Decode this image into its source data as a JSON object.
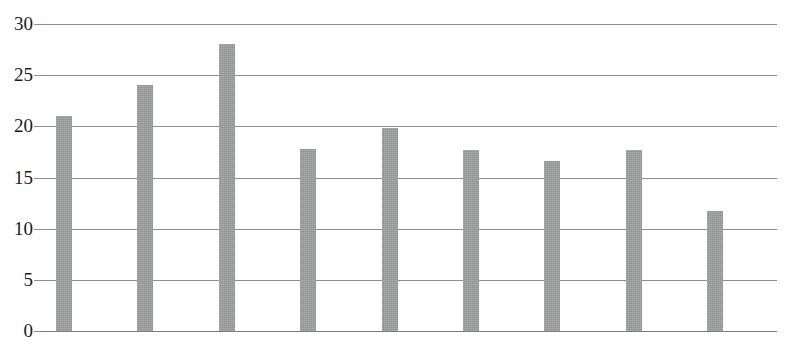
{
  "chart_data": {
    "type": "bar",
    "title": "",
    "xlabel": "",
    "ylabel": "",
    "categories": [
      "1",
      "2",
      "3",
      "4",
      "5",
      "6",
      "7",
      "8",
      "9"
    ],
    "values": [
      21.0,
      24.0,
      28.0,
      17.8,
      19.8,
      17.7,
      16.6,
      17.7,
      11.7
    ],
    "ylim": [
      0,
      30
    ],
    "ytick_labels": [
      "30",
      "25",
      "20",
      "15",
      "10",
      "5",
      "0"
    ],
    "ytick_values": [
      30,
      25,
      20,
      15,
      10,
      5,
      0
    ],
    "xtick_labels": [],
    "grid": "horizontal",
    "legend": "none",
    "bar_color": "#9a9b9b",
    "gridline_color": "#8e8e8e",
    "axis_text_color": "#1a1a1a"
  }
}
